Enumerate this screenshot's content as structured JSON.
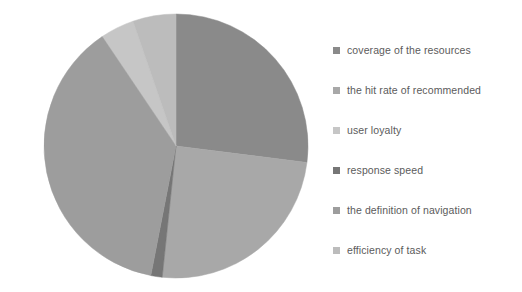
{
  "chart_data": {
    "type": "pie",
    "title": "",
    "legend_position": "right",
    "grid": false,
    "categories": [
      "coverage of the resources",
      "the hit rate of recommended",
      "user loyalty",
      "response speed",
      "the definition of navigation",
      "efficiency of task"
    ],
    "values": [
      27.0,
      24.7,
      4.2,
      1.4,
      37.5,
      5.2
    ],
    "colors": [
      "#8a8a8a",
      "#a8a8a8",
      "#c6c6c6",
      "#767676",
      "#9d9d9d",
      "#bcbcbc"
    ],
    "slices": [
      {
        "label": "coverage of the resources",
        "value": 27.0,
        "start_angle": 0,
        "end_angle": 97.2,
        "color": "#8a8a8a"
      },
      {
        "label": "the hit rate of recommended",
        "value": 24.7,
        "start_angle": 97.2,
        "end_angle": 186.0,
        "color": "#a8a8a8"
      },
      {
        "label": "user loyalty",
        "value": 4.2,
        "start_angle": 326.0,
        "end_angle": 341.0,
        "color": "#c6c6c6"
      },
      {
        "label": "response speed",
        "value": 1.4,
        "start_angle": 186.0,
        "end_angle": 191.0,
        "color": "#767676"
      },
      {
        "label": "the definition of navigation",
        "value": 37.5,
        "start_angle": 191.0,
        "end_angle": 326.0,
        "color": "#9d9d9d"
      },
      {
        "label": "efficiency of task",
        "value": 5.2,
        "start_angle": 341.0,
        "end_angle": 360.0,
        "color": "#bcbcbc"
      }
    ],
    "geometry": {
      "cx": 176,
      "cy": 146,
      "r": 132
    }
  },
  "legend": {
    "items": [
      {
        "label": "coverage of the resources",
        "color": "#8a8a8a",
        "marker": "square-swatch-icon"
      },
      {
        "label": "the hit rate of recommended",
        "color": "#a8a8a8",
        "marker": "square-swatch-icon"
      },
      {
        "label": "user loyalty",
        "color": "#c6c6c6",
        "marker": "square-swatch-icon"
      },
      {
        "label": "response speed",
        "color": "#767676",
        "marker": "square-swatch-icon"
      },
      {
        "label": "the definition of navigation",
        "color": "#9d9d9d",
        "marker": "square-swatch-icon"
      },
      {
        "label": "efficiency of task",
        "color": "#bcbcbc",
        "marker": "square-swatch-icon"
      }
    ]
  }
}
